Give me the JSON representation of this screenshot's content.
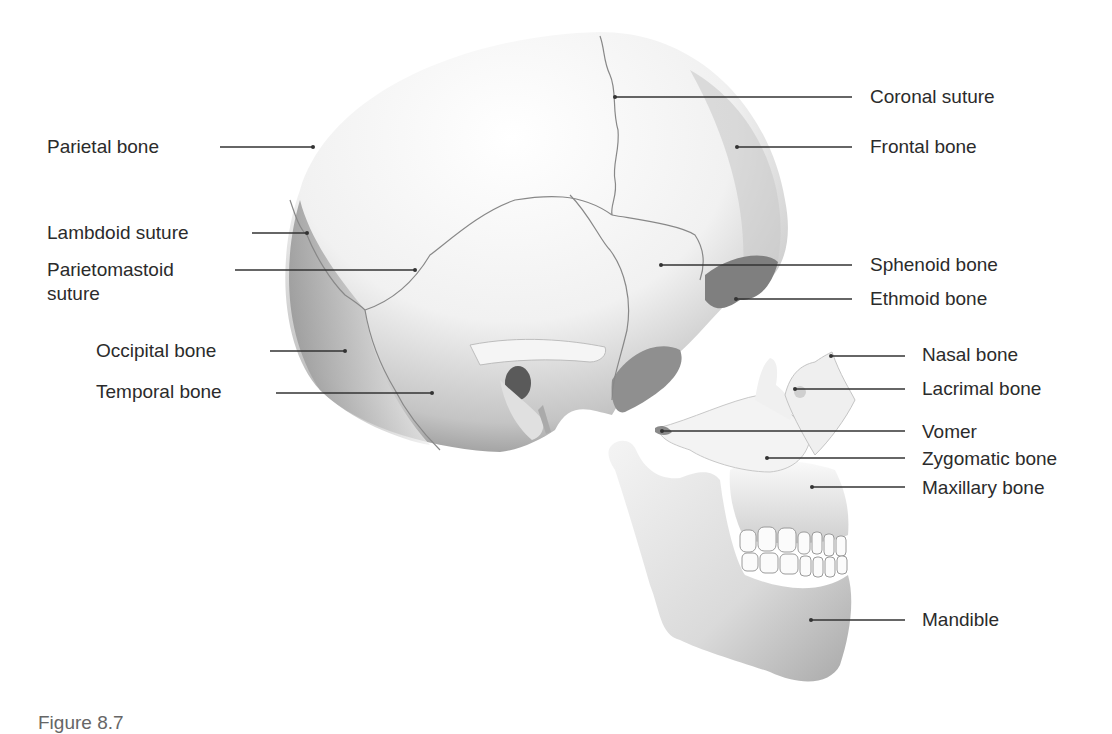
{
  "figure": {
    "caption": "Figure 8.7",
    "line_color": "#333333",
    "bone_color": "#e6e6e6",
    "shadow_color": "#8c8c8c"
  },
  "labels": {
    "left": [
      {
        "id": "parietal-bone",
        "text": "Parietal bone",
        "x": 47,
        "y": 135,
        "line": [
          220,
          147,
          313,
          147
        ]
      },
      {
        "id": "lambdoid-suture",
        "text": "Lambdoid suture",
        "x": 47,
        "y": 221,
        "line": [
          252,
          233,
          307,
          233
        ]
      },
      {
        "id": "parietomastoid-suture",
        "text": "Parietomastoid",
        "text2": "suture",
        "x": 47,
        "y": 258,
        "line": [
          235,
          270,
          415,
          270
        ]
      },
      {
        "id": "occipital-bone",
        "text": "Occipital bone",
        "x": 96,
        "y": 339,
        "line": [
          270,
          351,
          345,
          351
        ]
      },
      {
        "id": "temporal-bone",
        "text": "Temporal bone",
        "x": 96,
        "y": 380,
        "line": [
          276,
          393,
          432,
          393
        ]
      }
    ],
    "right": [
      {
        "id": "coronal-suture",
        "text": "Coronal suture",
        "x": 870,
        "y": 85,
        "line": [
          615,
          97,
          852,
          97
        ]
      },
      {
        "id": "frontal-bone",
        "text": "Frontal bone",
        "x": 870,
        "y": 135,
        "line": [
          737,
          147,
          852,
          147
        ]
      },
      {
        "id": "sphenoid-bone",
        "text": "Sphenoid bone",
        "x": 870,
        "y": 253,
        "line": [
          661,
          265,
          852,
          265
        ]
      },
      {
        "id": "ethmoid-bone",
        "text": "Ethmoid bone",
        "x": 870,
        "y": 287,
        "line": [
          736,
          299,
          852,
          299
        ]
      },
      {
        "id": "nasal-bone",
        "text": "Nasal bone",
        "x": 922,
        "y": 343,
        "line": [
          831,
          356,
          905,
          356
        ]
      },
      {
        "id": "lacrimal-bone",
        "text": "Lacrimal bone",
        "x": 922,
        "y": 377,
        "line": [
          795,
          389,
          905,
          389
        ]
      },
      {
        "id": "vomer",
        "text": "Vomer",
        "x": 922,
        "y": 420,
        "line": [
          662,
          431,
          905,
          431
        ]
      },
      {
        "id": "zygomatic-bone",
        "text": "Zygomatic bone",
        "x": 922,
        "y": 447,
        "line": [
          767,
          458,
          905,
          458
        ]
      },
      {
        "id": "maxillary-bone",
        "text": "Maxillary bone",
        "x": 922,
        "y": 476,
        "line": [
          812,
          487,
          905,
          487
        ]
      },
      {
        "id": "mandible",
        "text": "Mandible",
        "x": 922,
        "y": 608,
        "line": [
          811,
          620,
          905,
          620
        ]
      }
    ]
  }
}
